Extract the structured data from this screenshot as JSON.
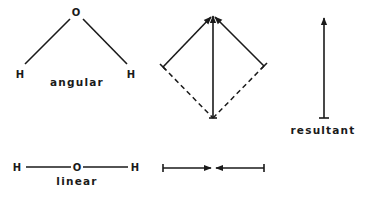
{
  "diagram": {
    "angular": {
      "atoms": {
        "center": "O",
        "left": "H",
        "right": "H"
      },
      "caption": "angular"
    },
    "linear": {
      "atoms": {
        "left": "H",
        "center": "O",
        "right": "H"
      },
      "caption": "linear"
    },
    "vector_sum_angular": {
      "description": "Two bond dipoles arranged as a parallelogram (diamond), with the diagonal showing the net sum"
    },
    "resultant": {
      "caption": "resultant"
    },
    "vector_sum_linear": {
      "description": "Two equal opposite bond dipoles that cancel"
    },
    "colors": {
      "ink": "#1a1a1a",
      "background": "#ffffff"
    }
  }
}
